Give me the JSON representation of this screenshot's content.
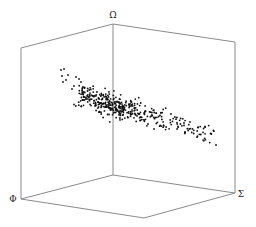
{
  "chart_data": {
    "type": "scatter",
    "dimensions": 3,
    "title": "",
    "axes": {
      "x": {
        "label": "Σ"
      },
      "y": {
        "label": "Φ"
      },
      "z": {
        "label": "Ω"
      }
    },
    "grid": false,
    "legend": null,
    "box": {
      "edge_color": "#8a8a8a",
      "vertices": {
        "left_top": [
          21,
          48
        ],
        "back_top": [
          113,
          24
        ],
        "right_top": [
          235,
          42
        ],
        "left_bottom": [
          21,
          199
        ],
        "back_bottom": [
          113,
          175
        ],
        "right_bottom": [
          235,
          193
        ],
        "front_bottom": [
          144,
          218
        ]
      },
      "edges": [
        [
          "left_top",
          "back_top"
        ],
        [
          "back_top",
          "right_top"
        ],
        [
          "left_top",
          "left_bottom"
        ],
        [
          "back_top",
          "back_bottom"
        ],
        [
          "right_top",
          "right_bottom"
        ],
        [
          "left_bottom",
          "back_bottom"
        ],
        [
          "back_bottom",
          "right_bottom"
        ],
        [
          "left_bottom",
          "front_bottom"
        ],
        [
          "front_bottom",
          "right_bottom"
        ]
      ]
    },
    "label_positions": {
      "z": [
        113,
        18
      ],
      "y": [
        13,
        202
      ],
      "x": [
        241,
        197
      ]
    },
    "point_color": "#111111",
    "point_radius": 0.9,
    "point_cloud_estimate": {
      "description": "Dense elongated band sloping from upper-left to lower-right, with a sparse scattering of outliers at the upper-left end",
      "screen_extent": {
        "x": [
          58,
          217
        ],
        "y": [
          68,
          146
        ]
      },
      "band_start": [
        78,
        95
      ],
      "band_end": [
        213,
        135
      ],
      "band_spread": 5.5,
      "dense_count": 420,
      "density_peak_t": 0.25,
      "outliers": [
        [
          61,
          70
        ],
        [
          64,
          69
        ],
        [
          62,
          76
        ],
        [
          68,
          75
        ],
        [
          63,
          82
        ],
        [
          66,
          80
        ],
        [
          76,
          77
        ],
        [
          79,
          79
        ],
        [
          81,
          82
        ],
        [
          74,
          86
        ],
        [
          83,
          87
        ],
        [
          72,
          89
        ],
        [
          216,
          145
        ],
        [
          190,
          122
        ],
        [
          171,
          114
        ],
        [
          148,
          124
        ],
        [
          185,
          132
        ]
      ],
      "seed": 7
    }
  }
}
